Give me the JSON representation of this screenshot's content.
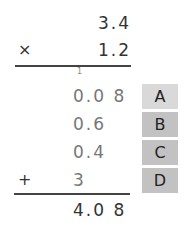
{
  "multiplication": {
    "multiplicand": "3.4",
    "multiplier": "1.2",
    "operator": "×",
    "carry": "1"
  },
  "partial_products": [
    {
      "value": "0.0 8",
      "label": "A",
      "box_color": "#d9d9d9"
    },
    {
      "value": "0.6",
      "label": "B",
      "box_color": "#c2c2c2"
    },
    {
      "value": "0.4",
      "label": "C",
      "box_color": "#c2c2c2"
    },
    {
      "value": "3",
      "label": "D",
      "box_color": "#c2c2c2"
    }
  ],
  "addition_operator": "+",
  "result": "4.0 8"
}
